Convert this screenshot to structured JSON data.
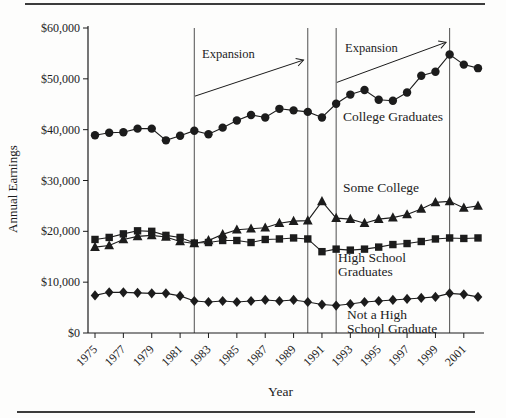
{
  "figure": {
    "ylabel": "Annual Earnings",
    "xlabel": "Year"
  },
  "chart_data": {
    "type": "line",
    "title": "",
    "xlabel": "Year",
    "ylabel": "Annual Earnings",
    "ylim": [
      0,
      60000
    ],
    "grid": false,
    "legend": "inline-annotations",
    "x": [
      1975,
      1976,
      1977,
      1978,
      1979,
      1980,
      1981,
      1982,
      1983,
      1984,
      1985,
      1986,
      1987,
      1988,
      1989,
      1990,
      1991,
      1992,
      1993,
      1994,
      1995,
      1996,
      1997,
      1998,
      1999,
      2000,
      2001,
      2002
    ],
    "x_tick_years": [
      1975,
      1977,
      1979,
      1981,
      1983,
      1985,
      1987,
      1989,
      1991,
      1993,
      1995,
      1997,
      1999,
      2001
    ],
    "x_tick_labels": [
      "1975",
      "1977",
      "1979",
      "1981",
      "1983",
      "1985",
      "1987",
      "1989",
      "1991",
      "1993",
      "1995",
      "1997",
      "1999",
      "2001"
    ],
    "y_ticks": [
      0,
      10000,
      20000,
      30000,
      40000,
      50000,
      60000
    ],
    "y_tick_labels": [
      "$0",
      "$10,000",
      "$20,000",
      "$30,000",
      "$40,000",
      "$50,000",
      "$60,000"
    ],
    "series": [
      {
        "name": "College Graduates",
        "marker": "circle",
        "values": [
          38900,
          39400,
          39500,
          40200,
          40200,
          37900,
          38800,
          39800,
          39100,
          40400,
          41800,
          42900,
          42400,
          44100,
          43800,
          43500,
          42400,
          45100,
          46900,
          47800,
          45900,
          45700,
          47300,
          50600,
          51400,
          54800,
          52800,
          52100
        ]
      },
      {
        "name": "Some College",
        "marker": "triangle",
        "values": [
          16900,
          17200,
          18400,
          19000,
          19200,
          18900,
          18000,
          17600,
          18200,
          19400,
          20300,
          20500,
          20700,
          21600,
          22000,
          22100,
          25900,
          22600,
          22400,
          21600,
          22400,
          22700,
          23300,
          24400,
          25700,
          25900,
          24600,
          25000
        ]
      },
      {
        "name": "High School Graduates",
        "marker": "square",
        "values": [
          18400,
          18800,
          19500,
          20100,
          20000,
          19200,
          18800,
          17700,
          17800,
          18200,
          18200,
          17800,
          18400,
          18500,
          18700,
          18500,
          16000,
          16500,
          16300,
          16500,
          16900,
          17400,
          17600,
          18000,
          18500,
          18700,
          18600,
          18700
        ]
      },
      {
        "name": "Not a High School Graduate",
        "marker": "diamond",
        "values": [
          7400,
          8000,
          8000,
          7900,
          7800,
          7800,
          7300,
          6300,
          6100,
          6300,
          6100,
          6300,
          6500,
          6300,
          6500,
          6100,
          5600,
          5400,
          5700,
          6100,
          6300,
          6500,
          6700,
          6900,
          7100,
          7800,
          7600,
          7100
        ]
      }
    ],
    "event_lines_years": [
      1982,
      1990,
      1992,
      2000
    ],
    "arrows": [
      {
        "label": "Expansion",
        "from_year": 1982.05,
        "from_value": 46600,
        "to_year": 1989.7,
        "to_value": 53700
      },
      {
        "label": "Expansion",
        "from_year": 1992.05,
        "from_value": 49300,
        "to_year": 1999.75,
        "to_value": 57200
      }
    ],
    "annotations": {
      "expansion_1": "Expansion",
      "expansion_2": "Expansion",
      "college_graduates": "College Graduates",
      "some_college": "Some College",
      "high_school_line1": "High School",
      "high_school_line2": "Graduates",
      "not_hs_line1": "Not a High",
      "not_hs_line2": "School Graduate"
    },
    "colors": {
      "ink": "#1c1c1c",
      "event_line": "#4f4f4f",
      "rule": "#3c3c3c"
    }
  }
}
